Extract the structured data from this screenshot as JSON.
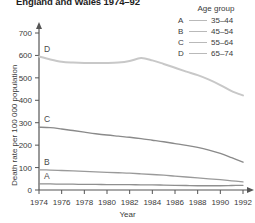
{
  "title": "England and Wales 1974–92",
  "legend": {
    "heading": "Age group",
    "items": [
      {
        "key": "A",
        "label": "35–44"
      },
      {
        "key": "B",
        "label": "45–54"
      },
      {
        "key": "C",
        "label": "55–64"
      },
      {
        "key": "D",
        "label": "65–74"
      }
    ]
  },
  "axes": {
    "ylabel": "Death rate per 100 000 population",
    "xlabel": "Year",
    "yticks": [
      "0",
      "100",
      "200",
      "300",
      "400",
      "500",
      "600",
      "700"
    ],
    "xticks": [
      "1974",
      "1976",
      "1978",
      "1980",
      "1982",
      "1984",
      "1986",
      "1988",
      "1990",
      "1992"
    ]
  },
  "series_letters": {
    "A": "A",
    "B": "B",
    "C": "C",
    "D": "D"
  },
  "colors": {
    "axis": "#555555",
    "series_a": "#8f8f8f",
    "series_b": "#9a9a9a",
    "series_c": "#8a8a8a",
    "series_d": "#c8c8c8",
    "legend_line": "#b9b9b9",
    "text": "#3a3a3a"
  },
  "chart_data": {
    "type": "line",
    "title": "England and Wales 1974–92",
    "xlabel": "Year",
    "ylabel": "Death rate per 100 000 population",
    "xlim": [
      1974,
      1992
    ],
    "ylim": [
      0,
      700
    ],
    "ytick_step": 100,
    "xtick_step": 2,
    "grid": false,
    "legend_position": "top-right",
    "legend_title": "Age group",
    "x": [
      1974,
      1975,
      1976,
      1977,
      1978,
      1979,
      1980,
      1981,
      1982,
      1983,
      1984,
      1985,
      1986,
      1987,
      1988,
      1989,
      1990,
      1991,
      1992
    ],
    "series": [
      {
        "name": "A",
        "label": "35–44",
        "values": [
          27,
          27,
          26,
          26,
          25,
          25,
          24,
          24,
          24,
          23,
          23,
          22,
          21,
          20,
          19,
          19,
          19,
          20,
          21
        ]
      },
      {
        "name": "B",
        "label": "45–54",
        "values": [
          90,
          89,
          87,
          85,
          83,
          81,
          79,
          77,
          75,
          72,
          69,
          66,
          62,
          58,
          54,
          50,
          46,
          41,
          36
        ]
      },
      {
        "name": "C",
        "label": "55–64",
        "values": [
          280,
          278,
          272,
          265,
          258,
          251,
          245,
          240,
          235,
          229,
          222,
          215,
          207,
          199,
          190,
          178,
          163,
          144,
          124
        ]
      },
      {
        "name": "D",
        "label": "65–74",
        "values": [
          595,
          582,
          572,
          568,
          566,
          566,
          566,
          568,
          575,
          588,
          578,
          562,
          545,
          528,
          512,
          492,
          468,
          441,
          422
        ]
      }
    ]
  }
}
